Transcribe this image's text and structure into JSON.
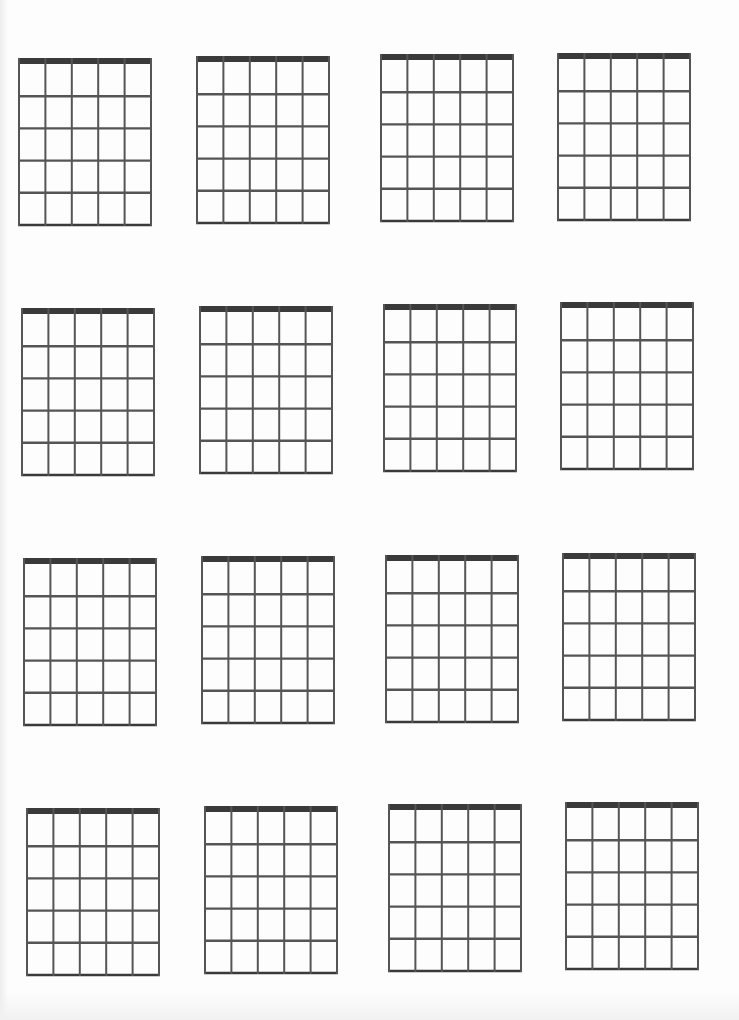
{
  "document": {
    "type": "blank-chord-diagram-sheet",
    "rows": 4,
    "columns": 4,
    "strings_per_diagram": 6,
    "frets_per_diagram": 5,
    "colors": {
      "background": "#fdfdfd",
      "nut": "#3a3a3a",
      "lines": "#555555"
    },
    "diagrams": [
      {
        "id": 1,
        "row": 1,
        "col": 1,
        "x": 18,
        "y": 58
      },
      {
        "id": 2,
        "row": 1,
        "col": 2,
        "x": 196,
        "y": 56
      },
      {
        "id": 3,
        "row": 1,
        "col": 3,
        "x": 380,
        "y": 54
      },
      {
        "id": 4,
        "row": 1,
        "col": 4,
        "x": 557,
        "y": 53
      },
      {
        "id": 5,
        "row": 2,
        "col": 1,
        "x": 21,
        "y": 308
      },
      {
        "id": 6,
        "row": 2,
        "col": 2,
        "x": 199,
        "y": 306
      },
      {
        "id": 7,
        "row": 2,
        "col": 3,
        "x": 383,
        "y": 304
      },
      {
        "id": 8,
        "row": 2,
        "col": 4,
        "x": 560,
        "y": 302
      },
      {
        "id": 9,
        "row": 3,
        "col": 1,
        "x": 23,
        "y": 558
      },
      {
        "id": 10,
        "row": 3,
        "col": 2,
        "x": 201,
        "y": 556
      },
      {
        "id": 11,
        "row": 3,
        "col": 3,
        "x": 385,
        "y": 555
      },
      {
        "id": 12,
        "row": 3,
        "col": 4,
        "x": 562,
        "y": 553
      },
      {
        "id": 13,
        "row": 4,
        "col": 1,
        "x": 26,
        "y": 808
      },
      {
        "id": 14,
        "row": 4,
        "col": 2,
        "x": 204,
        "y": 806
      },
      {
        "id": 15,
        "row": 4,
        "col": 3,
        "x": 388,
        "y": 804
      },
      {
        "id": 16,
        "row": 4,
        "col": 4,
        "x": 565,
        "y": 802
      }
    ]
  }
}
